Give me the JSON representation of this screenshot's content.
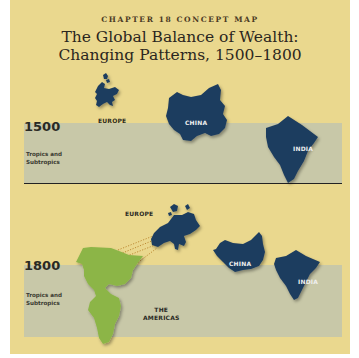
{
  "header": {
    "chapter": "CHAPTER 18 CONCEPT MAP",
    "title_line1": "The Global Balance of Wealth:",
    "title_line2": "Changing Patterns, 1500–1800"
  },
  "panels": [
    {
      "year": "1500",
      "band_label_line1": "Tropics and",
      "band_label_line2": "Subtropics",
      "regions": {
        "europe": "EUROPE",
        "china": "CHINA",
        "india": "INDIA"
      }
    },
    {
      "year": "1800",
      "band_label_line1": "Tropics and",
      "band_label_line2": "Subtropics",
      "regions": {
        "europe": "EUROPE",
        "china": "CHINA",
        "india": "INDIA",
        "americas_line1": "THE",
        "americas_line2": "AMERICAS"
      }
    }
  ],
  "colors": {
    "background": "#ead88e",
    "tropics_band": "#c8c8a8",
    "asia_europe_fill": "#1f3d5e",
    "americas_fill": "#8cb547"
  }
}
